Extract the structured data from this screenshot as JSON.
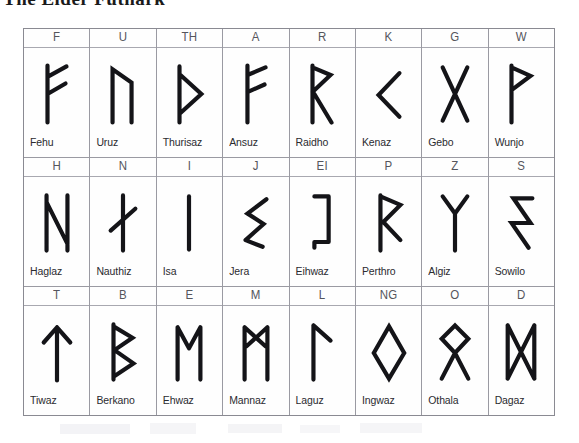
{
  "title": "The Elder Futhark",
  "table": {
    "rows": [
      [
        {
          "letter": "F",
          "name": "Fehu",
          "glyph": "rune-fehu"
        },
        {
          "letter": "U",
          "name": "Uruz",
          "glyph": "rune-uruz"
        },
        {
          "letter": "TH",
          "name": "Thurisaz",
          "glyph": "rune-thurisaz"
        },
        {
          "letter": "A",
          "name": "Ansuz",
          "glyph": "rune-ansuz"
        },
        {
          "letter": "R",
          "name": "Raidho",
          "glyph": "rune-raidho"
        },
        {
          "letter": "K",
          "name": "Kenaz",
          "glyph": "rune-kenaz"
        },
        {
          "letter": "G",
          "name": "Gebo",
          "glyph": "rune-gebo"
        },
        {
          "letter": "W",
          "name": "Wunjo",
          "glyph": "rune-wunjo"
        }
      ],
      [
        {
          "letter": "H",
          "name": "Haglaz",
          "glyph": "rune-haglaz"
        },
        {
          "letter": "N",
          "name": "Nauthiz",
          "glyph": "rune-nauthiz"
        },
        {
          "letter": "I",
          "name": "Isa",
          "glyph": "rune-isa"
        },
        {
          "letter": "J",
          "name": "Jera",
          "glyph": "rune-jera"
        },
        {
          "letter": "EI",
          "name": "Eihwaz",
          "glyph": "rune-eihwaz"
        },
        {
          "letter": "P",
          "name": "Perthro",
          "glyph": "rune-perthro"
        },
        {
          "letter": "Z",
          "name": "Algiz",
          "glyph": "rune-algiz"
        },
        {
          "letter": "S",
          "name": "Sowilo",
          "glyph": "rune-sowilo"
        }
      ],
      [
        {
          "letter": "T",
          "name": "Tiwaz",
          "glyph": "rune-tiwaz"
        },
        {
          "letter": "B",
          "name": "Berkano",
          "glyph": "rune-berkano"
        },
        {
          "letter": "E",
          "name": "Ehwaz",
          "glyph": "rune-ehwaz"
        },
        {
          "letter": "M",
          "name": "Mannaz",
          "glyph": "rune-mannaz"
        },
        {
          "letter": "L",
          "name": "Laguz",
          "glyph": "rune-laguz"
        },
        {
          "letter": "NG",
          "name": "Ingwaz",
          "glyph": "rune-ingwaz"
        },
        {
          "letter": "O",
          "name": "Othala",
          "glyph": "rune-othala"
        },
        {
          "letter": "D",
          "name": "Dagaz",
          "glyph": "rune-dagaz"
        }
      ]
    ]
  },
  "colors": {
    "ink": "#141418",
    "border": "#9a9aa2",
    "header_text": "#55555c",
    "background": "#ffffff"
  }
}
